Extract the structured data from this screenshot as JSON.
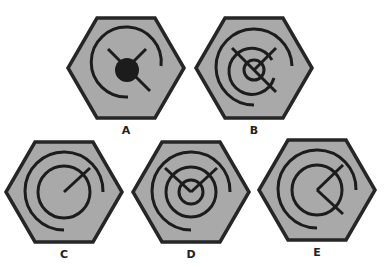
{
  "puzzle": {
    "type": "visual-reasoning-options",
    "colors": {
      "hexagon_fill": "#a9a9a9",
      "hexagon_stroke": "#262626",
      "line": "#1c1c1c",
      "background": "#ffffff"
    },
    "options": [
      {
        "label": "A",
        "description": "hexagon with outer 3/4 arc, two diagonal lines meeting at filled black center dot, one diagonal tail to lower-right"
      },
      {
        "label": "B",
        "description": "hexagon with outer arc, middle ring, small inner ring and X-shaped crossing lines"
      },
      {
        "label": "C",
        "description": "hexagon with outer arc, full middle circle and single radius line to upper-right"
      },
      {
        "label": "D",
        "description": "hexagon with outer arc, middle circle, inner circle and V-shaped lines from center to upper-left and upper-right"
      },
      {
        "label": "E",
        "description": "hexagon with outer arc, middle circle, and angle lines from center to upper-right and lower-right"
      }
    ]
  }
}
